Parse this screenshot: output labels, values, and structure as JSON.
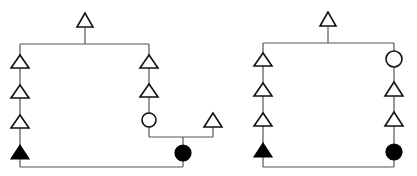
{
  "figure": {
    "type": "pedigree",
    "symbol_legend": {
      "open_triangle": "unaffected individual (sex unspecified)",
      "filled_triangle": "affected individual (sex unspecified)",
      "open_circle": "unaffected female",
      "filled_circle": "affected female"
    },
    "pedigrees": [
      {
        "id": "left",
        "founder": "open_triangle",
        "branches": [
          {
            "lineage": [
              "open_triangle",
              "open_triangle",
              "open_triangle",
              "filled_triangle"
            ]
          },
          {
            "lineage": [
              "open_triangle",
              "open_triangle",
              "open_circle"
            ],
            "mate": "open_triangle",
            "offspring": "filled_circle"
          }
        ],
        "consanguineous_mating": "filled_triangle x filled_circle"
      },
      {
        "id": "right",
        "founder": "open_triangle",
        "branches": [
          {
            "lineage": [
              "open_triangle",
              "open_triangle",
              "open_triangle",
              "filled_triangle"
            ]
          },
          {
            "lineage": [
              "open_circle",
              "open_triangle",
              "open_triangle",
              "filled_circle"
            ]
          }
        ],
        "consanguineous_mating": "filled_triangle x filled_circle"
      }
    ]
  }
}
